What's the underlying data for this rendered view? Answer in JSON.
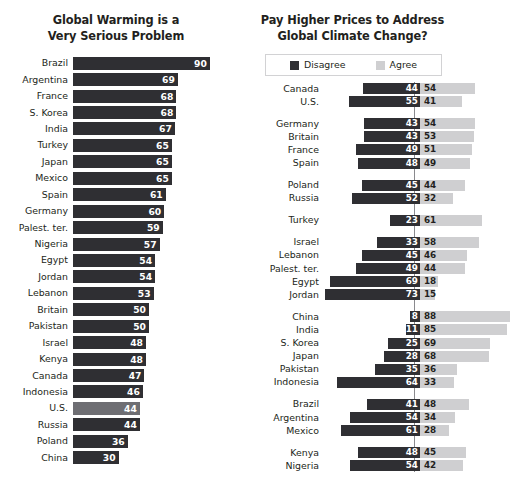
{
  "left": {
    "title_line1": "Global Warming is a",
    "title_line2": "Very Serious Problem"
  },
  "right": {
    "title_line1": "Pay Higher Prices to Address",
    "title_line2": "Global Climate Change?",
    "legend": {
      "disagree_label": "Disagree",
      "agree_label": "Agree",
      "disagree_color": "#2f2f33",
      "agree_color": "#cfcfd1"
    }
  },
  "chart_data": [
    {
      "type": "bar",
      "title": "Global Warming is a Very Serious Problem",
      "xlabel": "",
      "ylabel": "",
      "xlim": [
        0,
        100
      ],
      "grid": false,
      "orientation": "horizontal",
      "value_unit": "percent",
      "highlighted_category": "U.S.",
      "bar_color": "#2f2f33",
      "highlight_color": "#6e6e73",
      "categories": [
        "Brazil",
        "Argentina",
        "France",
        "S. Korea",
        "India",
        "Turkey",
        "Japan",
        "Mexico",
        "Spain",
        "Germany",
        "Palest. ter.",
        "Nigeria",
        "Egypt",
        "Jordan",
        "Lebanon",
        "Britain",
        "Pakistan",
        "Israel",
        "Kenya",
        "Canada",
        "Indonesia",
        "U.S.",
        "Russia",
        "Poland",
        "China"
      ],
      "values": [
        90,
        69,
        68,
        68,
        67,
        65,
        65,
        65,
        61,
        60,
        59,
        57,
        54,
        54,
        53,
        50,
        50,
        48,
        48,
        47,
        46,
        44,
        44,
        36,
        30
      ]
    },
    {
      "type": "bar",
      "title": "Pay Higher Prices to Address Global Climate Change?",
      "xlabel": "",
      "ylabel": "",
      "grid": false,
      "orientation": "horizontal",
      "layout": "diverging",
      "value_unit": "percent",
      "legend_position": "top",
      "categories": [
        "Canada",
        "U.S.",
        "Germany",
        "Britain",
        "France",
        "Spain",
        "Poland",
        "Russia",
        "Turkey",
        "Israel",
        "Lebanon",
        "Palest. ter.",
        "Egypt",
        "Jordan",
        "China",
        "India",
        "S. Korea",
        "Japan",
        "Pakistan",
        "Indonesia",
        "Brazil",
        "Argentina",
        "Mexico",
        "Kenya",
        "Nigeria"
      ],
      "group_breaks_after": [
        "U.S.",
        "Spain",
        "Russia",
        "Turkey",
        "Jordan",
        "Indonesia",
        "Mexico"
      ],
      "series": [
        {
          "name": "Disagree",
          "color": "#2f2f33",
          "values": [
            44,
            55,
            43,
            43,
            49,
            48,
            45,
            52,
            23,
            33,
            45,
            49,
            69,
            73,
            8,
            11,
            25,
            28,
            35,
            64,
            41,
            54,
            61,
            48,
            54
          ]
        },
        {
          "name": "Agree",
          "color": "#cfcfd1",
          "values": [
            54,
            41,
            54,
            53,
            51,
            49,
            44,
            32,
            61,
            58,
            46,
            44,
            18,
            15,
            88,
            85,
            69,
            68,
            36,
            33,
            48,
            34,
            28,
            45,
            42
          ]
        }
      ]
    }
  ]
}
